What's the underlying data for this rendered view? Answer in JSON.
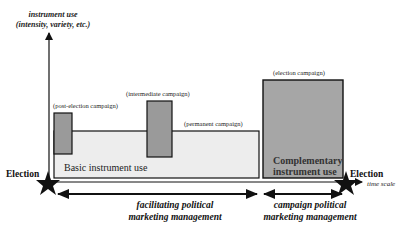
{
  "y_axis": {
    "title_line1": "instrument use",
    "title_line2": "(intensity, variety, etc.)"
  },
  "x_axis": {
    "label": "time scale"
  },
  "markers": {
    "start_label": "Election",
    "end_label": "Election"
  },
  "regions": {
    "basic": {
      "label": "Basic instrument use",
      "fill": "#ededed"
    },
    "post_election": {
      "label": "(post-election campaign)",
      "fill": "#9a9a9a"
    },
    "intermediate": {
      "label": "(intermediate campaign)",
      "fill": "#9a9a9a"
    },
    "permanent": {
      "label": "(permanent campaign)"
    },
    "election": {
      "label": "(election campaign)",
      "fill": "#a6a6a6"
    },
    "complementary": {
      "line1": "Complementary",
      "line2": "instrument use"
    }
  },
  "phases": {
    "facilitating": {
      "line1": "facilitating political",
      "line2": "marketing management"
    },
    "campaign": {
      "line1": "campaign political",
      "line2": "marketing management"
    }
  },
  "colors": {
    "stroke": "#111111",
    "light_fill": "#ededed",
    "dark_fill": "#9a9a9a",
    "election_fill": "#a6a6a6"
  }
}
